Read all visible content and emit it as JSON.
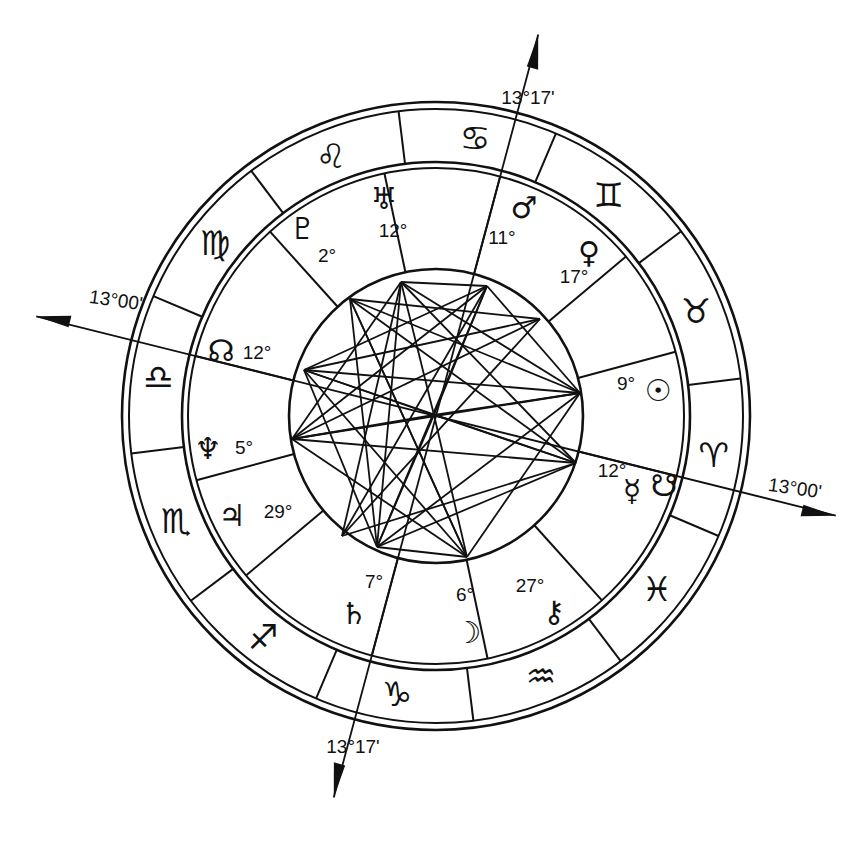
{
  "geometry": {
    "cx": 436,
    "cy": 416,
    "r_outer1": 314,
    "r_outer2": 307,
    "r_zodiac_in1": 254,
    "r_zodiac_in2": 248,
    "r_inner": 147,
    "asc_angle_deg": 166
  },
  "axes": {
    "ascendant": {
      "label": "13°00'",
      "angle": 166
    },
    "descendant": {
      "label": "13°00'",
      "angle": -14
    },
    "midheaven": {
      "label": "13°17'",
      "angle": 75
    },
    "imum_coeli": {
      "label": "13°17'",
      "angle": 255
    }
  },
  "signs": [
    {
      "name": "aries",
      "glyph": "♈",
      "angle": -8
    },
    {
      "name": "taurus",
      "glyph": "♉",
      "angle": 22
    },
    {
      "name": "gemini",
      "glyph": "♊",
      "angle": 52
    },
    {
      "name": "cancer",
      "glyph": "♋",
      "angle": 82
    },
    {
      "name": "leo",
      "glyph": "♌",
      "angle": 112
    },
    {
      "name": "virgo",
      "glyph": "♍",
      "angle": 142
    },
    {
      "name": "libra",
      "glyph": "♎",
      "angle": 172
    },
    {
      "name": "scorpio",
      "glyph": "♏",
      "angle": 202
    },
    {
      "name": "sagittarius",
      "glyph": "♐",
      "angle": 232
    },
    {
      "name": "capricorn",
      "glyph": "♑",
      "angle": 262
    },
    {
      "name": "aquarius",
      "glyph": "♒",
      "angle": 292
    },
    {
      "name": "pisces",
      "glyph": "♓",
      "angle": 322
    }
  ],
  "sign_cusps": [
    7,
    37,
    67,
    97,
    127,
    157,
    187,
    217,
    247,
    277,
    307,
    337
  ],
  "house_cusps": [
    166,
    195,
    220,
    255,
    282,
    312,
    346,
    15,
    40,
    75,
    102,
    132
  ],
  "planets": [
    {
      "name": "sun",
      "glyph": "☉",
      "degree": "9°",
      "x": 658,
      "y": 390,
      "dx": 626,
      "dy": 383
    },
    {
      "name": "mercury",
      "glyph": "☿",
      "degree": "12°",
      "x": 632,
      "y": 490,
      "dx": 612,
      "dy": 470
    },
    {
      "name": "south-node",
      "glyph": "☋",
      "degree": "",
      "x": 664,
      "y": 485,
      "dx": 0,
      "dy": 0
    },
    {
      "name": "venus",
      "glyph": "♀",
      "degree": "17°",
      "x": 589,
      "y": 252,
      "dx": 574,
      "dy": 276
    },
    {
      "name": "mars",
      "glyph": "♂",
      "degree": "11°",
      "x": 524,
      "y": 207,
      "dx": 502,
      "dy": 237
    },
    {
      "name": "uranus",
      "glyph": "♅",
      "degree": "12°",
      "x": 384,
      "y": 198,
      "dx": 393,
      "dy": 230
    },
    {
      "name": "pluto",
      "glyph": "♇",
      "degree": "2°",
      "x": 303,
      "y": 228,
      "dx": 327,
      "dy": 255
    },
    {
      "name": "north-node",
      "glyph": "☊",
      "degree": "12°",
      "x": 221,
      "y": 350,
      "dx": 257,
      "dy": 352
    },
    {
      "name": "neptune",
      "glyph": "♆",
      "degree": "5°",
      "x": 208,
      "y": 448,
      "dx": 244,
      "dy": 447
    },
    {
      "name": "jupiter",
      "glyph": "♃",
      "degree": "29°",
      "x": 232,
      "y": 515,
      "dx": 278,
      "dy": 511
    },
    {
      "name": "saturn",
      "glyph": "♄",
      "degree": "7°",
      "x": 354,
      "y": 613,
      "dx": 374,
      "dy": 581
    },
    {
      "name": "moon",
      "glyph": "☽",
      "degree": "6°",
      "x": 468,
      "y": 632,
      "dx": 465,
      "dy": 594
    },
    {
      "name": "chiron",
      "glyph": "⚷",
      "degree": "27°",
      "x": 554,
      "y": 611,
      "dx": 530,
      "dy": 585
    }
  ],
  "aspect_points": [
    [
      401,
      282
    ],
    [
      487,
      286
    ],
    [
      304,
      370
    ],
    [
      580,
      393
    ],
    [
      292,
      439
    ],
    [
      576,
      463
    ],
    [
      377,
      547
    ],
    [
      467,
      557
    ],
    [
      434,
      415
    ],
    [
      350,
      299
    ],
    [
      540,
      319
    ],
    [
      342,
      536
    ]
  ],
  "aspects": [
    [
      0,
      1
    ],
    [
      0,
      4
    ],
    [
      0,
      6
    ],
    [
      0,
      8
    ],
    [
      0,
      3
    ],
    [
      0,
      5
    ],
    [
      0,
      11
    ],
    [
      1,
      2
    ],
    [
      1,
      4
    ],
    [
      1,
      6
    ],
    [
      1,
      8
    ],
    [
      1,
      3
    ],
    [
      1,
      11
    ],
    [
      2,
      3
    ],
    [
      2,
      5
    ],
    [
      2,
      6
    ],
    [
      2,
      8
    ],
    [
      2,
      10
    ],
    [
      3,
      8
    ],
    [
      3,
      4
    ],
    [
      3,
      6
    ],
    [
      3,
      7
    ],
    [
      4,
      5
    ],
    [
      4,
      7
    ],
    [
      4,
      8
    ],
    [
      4,
      10
    ],
    [
      5,
      6
    ],
    [
      5,
      8
    ],
    [
      5,
      9
    ],
    [
      6,
      7
    ],
    [
      6,
      8
    ],
    [
      6,
      9
    ],
    [
      7,
      8
    ],
    [
      7,
      2
    ],
    [
      7,
      9
    ],
    [
      9,
      10
    ],
    [
      9,
      3
    ],
    [
      10,
      11
    ],
    [
      11,
      5
    ],
    [
      9,
      7
    ]
  ]
}
